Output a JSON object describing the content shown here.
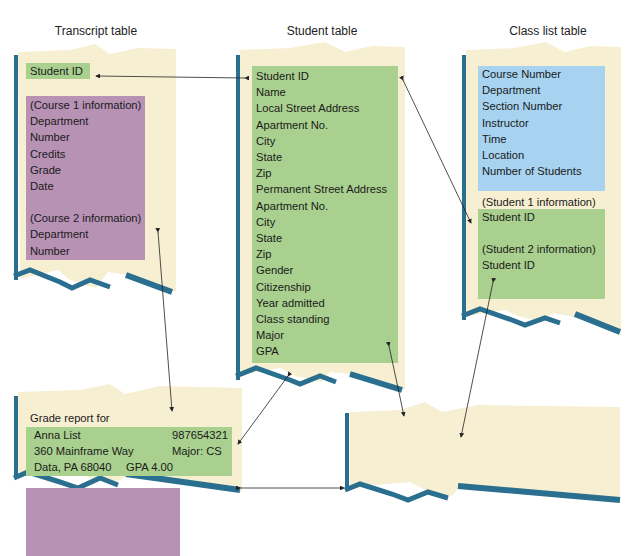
{
  "colors": {
    "paper": "#f7efd2",
    "edge": "#2a6f8f",
    "green": "#a9d08e",
    "purple": "#b892b4",
    "blue": "#a7d3f0"
  },
  "titles": {
    "transcript": "Transcript table",
    "student": "Student table",
    "class_list": "Class list table"
  },
  "transcript_table": {
    "key": "Student ID",
    "course1_header": "(Course 1 information)",
    "course1_fields": [
      "Department",
      "Number",
      "Credits",
      "Grade",
      "Date"
    ],
    "course2_header": "(Course 2 information)",
    "course2_fields": [
      "Department",
      "Number"
    ]
  },
  "student_table": {
    "fields": [
      "Student ID",
      "Name",
      "Local Street Address",
      "Apartment No.",
      "City",
      "State",
      "Zip",
      "Permanent Street Address",
      "Apartment No.",
      "City",
      "State",
      "Zip",
      "Gender",
      "Citizenship",
      "Year admitted",
      "Class standing",
      "Major",
      "GPA"
    ]
  },
  "class_list_table": {
    "course_fields": [
      "Course Number",
      "Department",
      "Section Number",
      "Instructor",
      "Time",
      "Location",
      "Number of Students"
    ],
    "student1_header": "(Student 1 information)",
    "student1_field": "Student ID",
    "student2_header": "(Student 2 information)",
    "student2_field": "Student ID"
  },
  "grade_report": {
    "heading": "Grade report for",
    "name": "Anna List",
    "id": "987654321",
    "street": "360 Mainframe Way",
    "major": "Major: CS",
    "city": "Data, PA 68040",
    "gpa": "GPA 4.00",
    "courses": [
      {
        "dept": "CS",
        "num": "101",
        "credits": "4",
        "grade": "A"
      },
      {
        "dept": "MTH",
        "num": "251",
        "credits": "5",
        "grade": "A"
      },
      {
        "dept": "HST",
        "num": "101",
        "credits": "3",
        "grade": "A"
      },
      {
        "dept": "WRT",
        "num": "131",
        "credits": "3",
        "grade": "A"
      }
    ]
  },
  "class_list": {
    "heading": "Class List for",
    "days": "MWF",
    "course": "CS 101",
    "time": "10:30AM",
    "section": "Section 1",
    "students": "197 students",
    "instructor": "Instructor:  Cursor",
    "columns": [
      "ID",
      "NAME",
      "YR",
      "MAJ"
    ],
    "rows": [
      {
        "id": "123456789",
        "name": "BIT, AL",
        "yr": "SO",
        "maj": "MTH"
      },
      {
        "id": "987654321",
        "name": "LIST, ANNA",
        "yr": "FR",
        "maj": "CS"
      }
    ]
  },
  "link_label": "Student ID"
}
